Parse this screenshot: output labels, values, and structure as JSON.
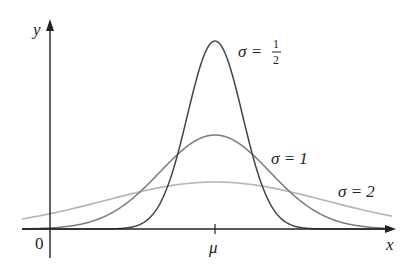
{
  "chart_data": {
    "type": "line",
    "xlabel": "x",
    "ylabel": "y",
    "x_tick_labels": [
      "0",
      "μ"
    ],
    "grid": false,
    "legend": "inline annotations",
    "series": [
      {
        "name": "σ = 1/2",
        "label_sigma": "σ =",
        "label_num": "1",
        "label_den": "2",
        "sigma": 0.5,
        "peak_relative": 4,
        "color": "#444444"
      },
      {
        "name": "σ = 1",
        "label": "σ = 1",
        "sigma": 1,
        "peak_relative": 2,
        "color": "#7a7a7a"
      },
      {
        "name": "σ = 2",
        "label": "σ = 2",
        "sigma": 2,
        "peak_relative": 1,
        "color": "#b5b5b5"
      }
    ],
    "annotations": [
      "σ = 1/2",
      "σ = 1",
      "σ = 2"
    ]
  },
  "axes": {
    "x_label": "x",
    "y_label": "y",
    "origin_label": "0",
    "mu_label": "μ"
  },
  "layout": {
    "x0": 50,
    "mu_x": 215,
    "axis_y": 229,
    "px_per_sigma": 55,
    "peak_half": 188,
    "x_min": 22,
    "x_max": 392
  }
}
